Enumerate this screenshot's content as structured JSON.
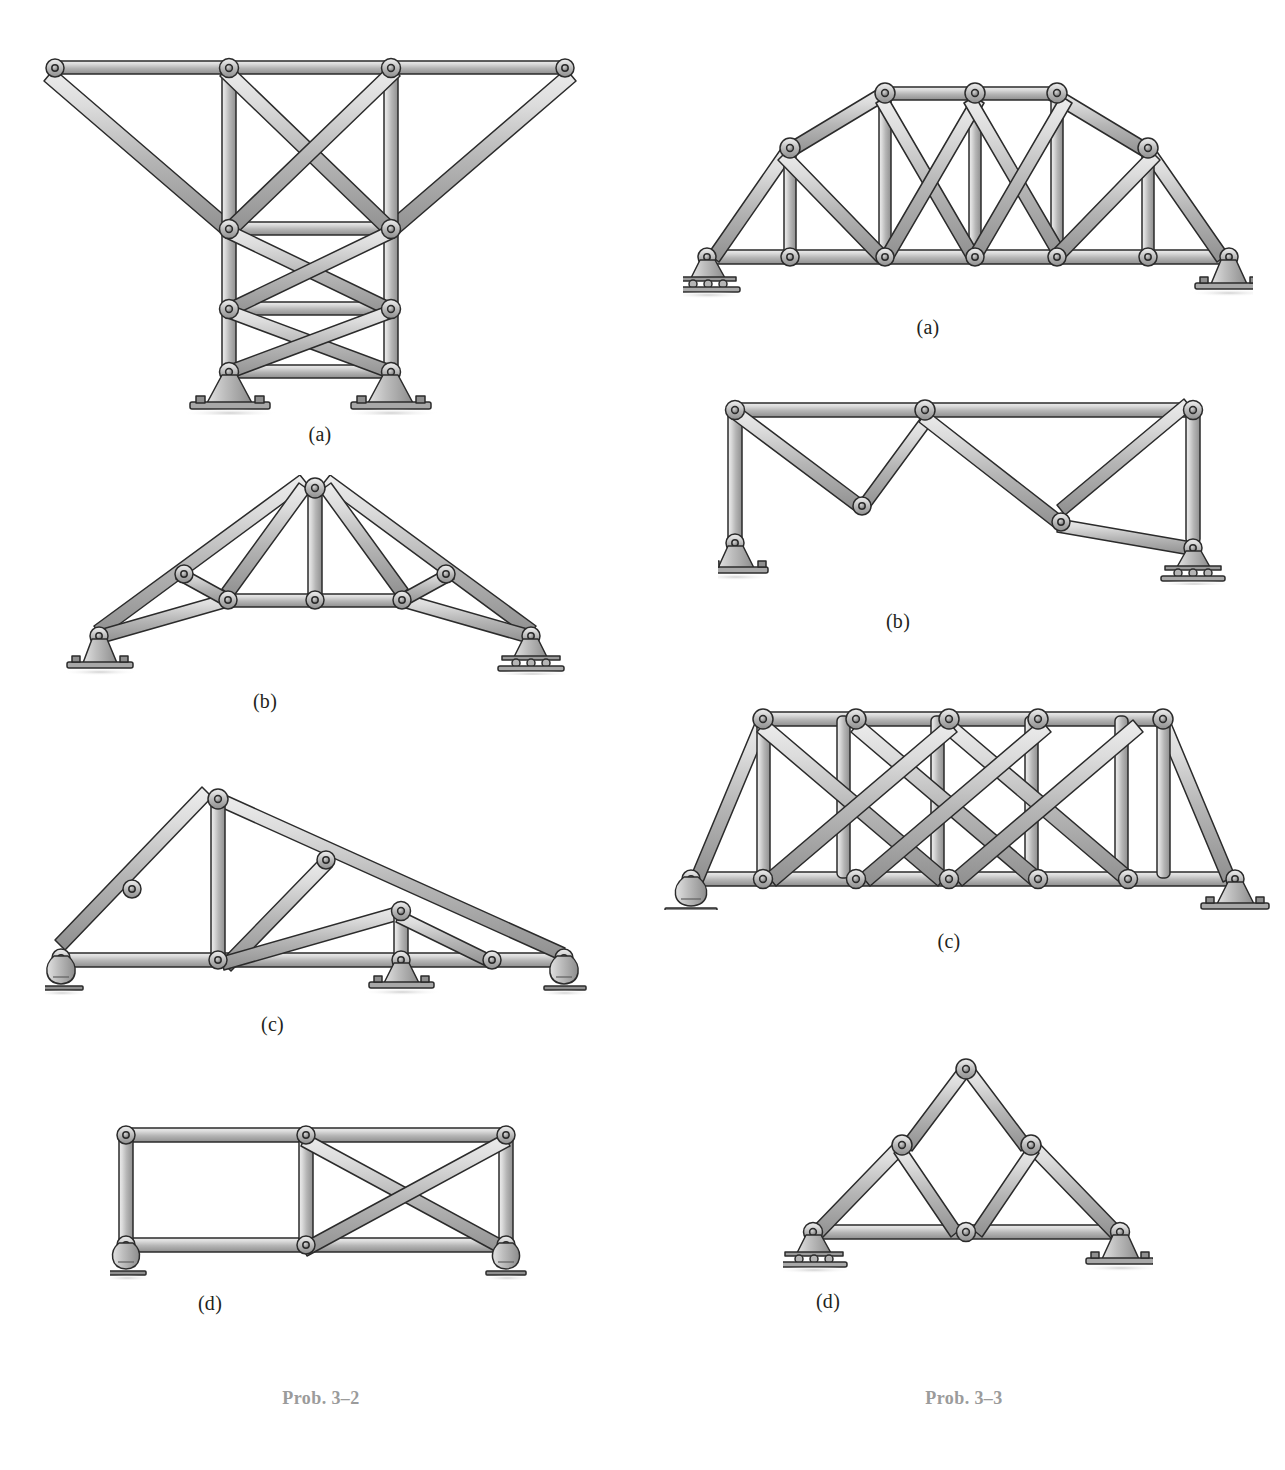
{
  "page": {
    "width": 1285,
    "height": 1470,
    "background": "#ffffff",
    "type": "textbook-figure-page"
  },
  "colors": {
    "member_light": "#d9d9d9",
    "member_mid": "#b3b3b3",
    "member_dark": "#8a8a8a",
    "outline": "#2b2b2b",
    "pin_fill": "#9a9a9a",
    "support_fill": "#b0b0b0",
    "base_plate": "#a8a8a8",
    "shadow": "#d7d7d7",
    "label_text": "#231f20",
    "caption_text": "#9b9b9b"
  },
  "left_column": {
    "caption": "Prob. 3–2",
    "figures": [
      {
        "id": "prob3-2-a",
        "label": "(a)",
        "name": "cantilevered-tower-truss",
        "description": "T-shaped tower truss with two cantilever arms and three stacked cross-braced panels, supported on two pin supports",
        "supports": [
          "pin",
          "pin"
        ],
        "joints": 12,
        "members": 19
      },
      {
        "id": "prob3-2-b",
        "label": "(b)",
        "name": "fink-roof-truss",
        "description": "Symmetric gable roof truss with cambered bottom chord, central king post and four diagonal web members",
        "supports": [
          "pin",
          "roller"
        ],
        "joints": 9,
        "members": 15
      },
      {
        "id": "prob3-2-c",
        "label": "(c)",
        "name": "asymmetric-lean-to-truss",
        "description": "Asymmetric truss with steep left slope and shallow right slope, three supports along the bottom chord",
        "supports": [
          "rocker",
          "pin",
          "rocker"
        ],
        "joints": 9,
        "members": 15
      },
      {
        "id": "prob3-2-d",
        "label": "(d)",
        "name": "two-panel-rectangular-frame",
        "description": "Rectangular two-panel frame: left panel unbraced, right panel cross-braced, on two rocker supports",
        "supports": [
          "rocker",
          "rocker"
        ],
        "joints": 6,
        "members": 9
      }
    ]
  },
  "right_column": {
    "caption": "Prob. 3–3",
    "figures": [
      {
        "id": "prob3-3-a",
        "label": "(a)",
        "name": "parker-camelback-truss",
        "description": "Camelback / Parker through truss with polygonal top chord, vertical posts and crossed diagonals",
        "supports": [
          "roller",
          "pin"
        ],
        "joints": 11,
        "members": 21
      },
      {
        "id": "prob3-3-b",
        "label": "(b)",
        "name": "rectangular-frame-two-diagonals",
        "description": "Rectangular frame with a single top chord, two end verticals and two long diagonals meeting at mid top joint",
        "supports": [
          "pin",
          "roller"
        ],
        "joints": 6,
        "members": 7
      },
      {
        "id": "prob3-3-c",
        "label": "(c)",
        "name": "baltimore-double-diagonal-truss",
        "description": "Parallel chord truss with inclined end posts, five vertical posts and double-intersection (crossed) diagonals",
        "supports": [
          "rocker",
          "pin"
        ],
        "joints": 12,
        "members": 23
      },
      {
        "id": "prob3-3-d",
        "label": "(d)",
        "name": "triangular-three-panel-truss",
        "description": "Simple triangular truss with apex joint, two mid-chord joints and an inverted V of web members",
        "supports": [
          "roller",
          "pin"
        ],
        "joints": 6,
        "members": 9
      }
    ]
  },
  "legend": {
    "support_types": {
      "pin": "pinned support with bolted base plate",
      "roller": "roller support with three rollers on base plate",
      "rocker": "rocker / pendulum support on ground line"
    },
    "joint_type": "pinned joint shown as a round eye with a central pin"
  },
  "top_fragments": {
    "left": "",
    "right": ""
  }
}
